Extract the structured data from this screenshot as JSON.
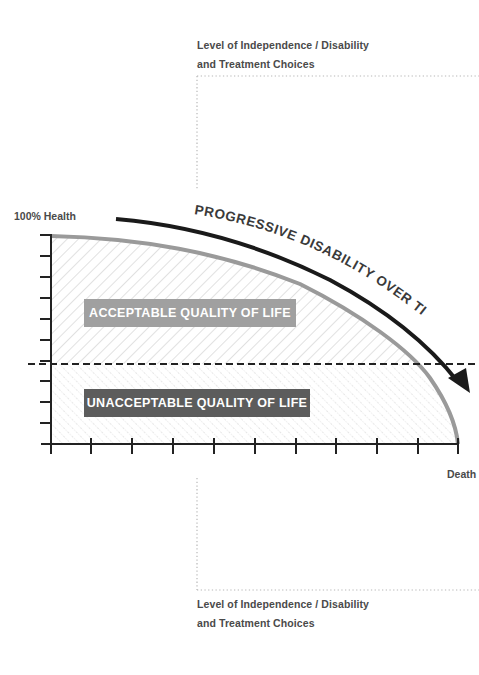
{
  "diagram": {
    "title_arc": "PROGRESSIVE DISABILITY OVER TIME",
    "top_caption": {
      "line1": "Level of Independence / Disability",
      "line2": "and Treatment Choices"
    },
    "bottom_caption": {
      "line1": "Level of Independence / Disability",
      "line2": "and Treatment Choices"
    },
    "y_axis_top_label": "100% Health",
    "x_axis_end_label": "Death",
    "regions": {
      "acceptable": {
        "label": "ACCEPTABLE QUALITY OF LIFE",
        "box_color": "#a0a0a0",
        "pattern": "diagonal-hatch"
      },
      "unacceptable": {
        "label": "UNACCEPTABLE QUALITY OF LIFE",
        "box_color": "#5c5c5c",
        "pattern": "dotted-diagonal-hatch"
      }
    },
    "threshold_line": "dashed",
    "curve_color": "#9a9a9a",
    "arrow_color": "#1a1a1a",
    "y_axis_ticks": 11,
    "x_axis_ticks": 11
  }
}
